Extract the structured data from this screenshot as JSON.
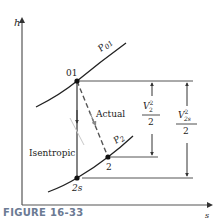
{
  "figure": {
    "caption": "FIGURE 16-33",
    "y_axis_label": "h",
    "x_axis_label": "s",
    "curves": {
      "upper_pressure_label": "P01",
      "upper_pressure_main": "P",
      "upper_pressure_sub": "01",
      "lower_pressure_label": "P2",
      "lower_pressure_main": "P",
      "lower_pressure_sub": "2"
    },
    "points": {
      "stagnation": "01",
      "actual_exit": "2",
      "isentropic_exit": "2s"
    },
    "process_labels": {
      "actual": "Actual",
      "isentropic": "Isentropic"
    },
    "dimensions": {
      "actual_ke_numerator": "V",
      "actual_ke_sup": "2",
      "actual_ke_sub": "2",
      "actual_ke_denominator": "2",
      "isentropic_ke_numerator": "V",
      "isentropic_ke_sup": "2",
      "isentropic_ke_sub": "2s",
      "isentropic_ke_denominator": "2"
    },
    "colors": {
      "line": "#222222",
      "gray_arrow": "#888888",
      "caption": "#6b7a93"
    }
  }
}
